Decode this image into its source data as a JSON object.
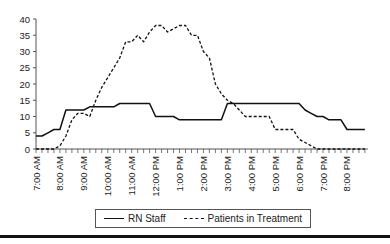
{
  "chart_data": {
    "type": "line",
    "title": "",
    "xlabel": "",
    "ylabel": "",
    "ylim": [
      0,
      40
    ],
    "yticks": [
      0,
      5,
      10,
      15,
      20,
      25,
      30,
      35,
      40
    ],
    "xtick_labels": [
      "7:00 AM",
      "8:00 AM",
      "9:00 AM",
      "10:00 AM",
      "11:00 AM",
      "12:00 PM",
      "1:00 PM",
      "2:00 PM",
      "3:00 PM",
      "4:00 PM",
      "5:00 PM",
      "6:00 PM",
      "7:00 PM",
      "8:00 PM"
    ],
    "x_interval_minutes": 15,
    "x_start": "7:00 AM",
    "legend_position": "bottom",
    "grid": false,
    "series": [
      {
        "name": "RN Staff",
        "style": "solid",
        "values": [
          4,
          4,
          5,
          6,
          6,
          12,
          12,
          12,
          12,
          13,
          13,
          13,
          13,
          13,
          14,
          14,
          14,
          14,
          14,
          14,
          10,
          10,
          10,
          10,
          9,
          9,
          9,
          9,
          9,
          9,
          9,
          9,
          14,
          14,
          14,
          14,
          14,
          14,
          14,
          14,
          14,
          14,
          14,
          14,
          14,
          12,
          11,
          10,
          10,
          9,
          9,
          9,
          6,
          6,
          6,
          6
        ]
      },
      {
        "name": "Patients in Treatment",
        "style": "dashed",
        "values": [
          0,
          0,
          0,
          0,
          1,
          4,
          9,
          11,
          11,
          10,
          15,
          19,
          22,
          25,
          28,
          33,
          33,
          35,
          33,
          36,
          38,
          38,
          36,
          37,
          38,
          38,
          35,
          35,
          30,
          28,
          20,
          17,
          15,
          14,
          12,
          10,
          10,
          10,
          10,
          10,
          6,
          6,
          6,
          6,
          3,
          2,
          1,
          0,
          0,
          0,
          0,
          0,
          0,
          0,
          0,
          0
        ]
      }
    ]
  },
  "legend": {
    "items": [
      {
        "label": "RN Staff"
      },
      {
        "label": "Patients in Treatment"
      }
    ]
  }
}
